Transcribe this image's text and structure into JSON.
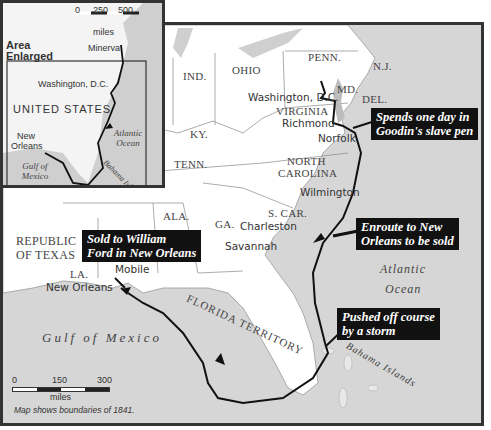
{
  "inset": {
    "heading": "Area Enlarged",
    "scale": {
      "ticks": [
        "0",
        "250",
        "500"
      ],
      "unit": "miles"
    },
    "labels": {
      "minerva": "Minerva",
      "washington": "Washington, D.C.",
      "country": "UNITED STATES",
      "new_orleans": "New Orleans",
      "atlantic": "Atlantic Ocean",
      "gulf": "Gulf of Mexico",
      "bahamas": "Bahama Islands"
    }
  },
  "states": {
    "ind": "IND.",
    "ohio": "OHIO",
    "penn": "PENN.",
    "nj": "N.J.",
    "md": "MD.",
    "del": "DEL.",
    "virginia": "VIRGINIA",
    "ky": "KY.",
    "tenn": "TENN.",
    "nc_line1": "NORTH",
    "nc_line2": "CAROLINA",
    "sc": "S. CAR.",
    "ga": "GA.",
    "ala": "ALA.",
    "la": "LA.",
    "texas_line1": "REPUBLIC",
    "texas_line2": "OF TEXAS",
    "florida": "FLORIDA TERRITORY"
  },
  "cities": {
    "washington": "Washington, D.C.",
    "richmond": "Richmond",
    "norfolk": "Norfolk",
    "wilmington": "Wilmington",
    "charleston": "Charleston",
    "savannah": "Savannah",
    "mobile": "Mobile",
    "new_orleans": "New Orleans"
  },
  "water": {
    "atlantic_line1": "Atlantic",
    "atlantic_line2": "Ocean",
    "gulf": "Gulf of Mexico",
    "bahamas": "Bahama Islands"
  },
  "callouts": {
    "slave_pen": [
      "Spends one day in",
      "Goodin's slave pen"
    ],
    "enroute": [
      "Enroute to New",
      "Orleans to be sold"
    ],
    "storm": [
      "Pushed off course",
      "by a storm"
    ],
    "sold": [
      "Sold to William",
      "Ford in New Orleans"
    ]
  },
  "scale": {
    "ticks": [
      "0",
      "150",
      "300"
    ],
    "unit": "miles"
  },
  "note": "Map shows boundaries of 1841.",
  "colors": {
    "land": "#ffffff",
    "water": "#d6d6d6",
    "route": "#111111",
    "callout_bg": "#111111"
  }
}
